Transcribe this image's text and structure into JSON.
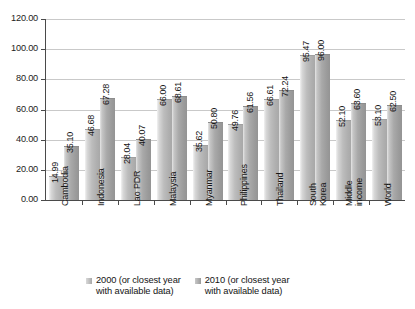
{
  "chart_data": {
    "type": "bar",
    "title": "",
    "subtitle": "",
    "xlabel": "",
    "ylabel": "",
    "ylim": [
      0,
      120
    ],
    "ytick_step": 20,
    "ytick_labels": [
      "0.00",
      "20.00",
      "40.00",
      "60.00",
      "80.00",
      "100.00",
      "120.00"
    ],
    "grid": true,
    "legend_position": "bottom",
    "categories": [
      "Cambodia",
      "Indonesia",
      "Lao PDR",
      "Malaysia",
      "Myanmar",
      "Philippines",
      "South Korea",
      "Thailand",
      "Middle income",
      "World"
    ],
    "category_display": [
      [
        "Cambodia"
      ],
      [
        "Indonesia"
      ],
      [
        "Lao PDR"
      ],
      [
        "Malaysia"
      ],
      [
        "Myanmar"
      ],
      [
        "Philippines"
      ],
      [
        "Thailand"
      ],
      [
        "South",
        "Korea"
      ],
      [
        "Middle",
        "income"
      ],
      [
        "World"
      ]
    ],
    "series": [
      {
        "name": "2000 (or closest year with available data)",
        "values": [
          14.99,
          46.68,
          28.04,
          66.0,
          35.62,
          49.76,
          66.61,
          95.47,
          52.1,
          53.1
        ],
        "value_labels": [
          "14.99",
          "46.68",
          "28.04",
          "66.00",
          "35.62",
          "49.76",
          "66.61",
          "95.47",
          "52.10",
          "53.10"
        ],
        "color": "#b5b5b5"
      },
      {
        "name": "2010 (or closest year with available data)",
        "values": [
          35.1,
          67.28,
          40.07,
          68.61,
          50.8,
          61.56,
          72.24,
          96.0,
          63.6,
          62.5
        ],
        "value_labels": [
          "35.10",
          "67.28",
          "40.07",
          "68.61",
          "50.80",
          "61.56",
          "72.24",
          "96.00",
          "63.60",
          "62.50"
        ],
        "color": "#a2a2a2"
      }
    ],
    "ordered_categories": [
      "Cambodia",
      "Indonesia",
      "Lao PDR",
      "Malaysia",
      "Myanmar",
      "Philippines",
      "Thailand",
      "South Korea",
      "Middle income",
      "World"
    ]
  },
  "legend": {
    "entries": [
      {
        "label": "2000 (or closest year\nwith available data)"
      },
      {
        "label": "2010 (or closest year\nwith available data)"
      }
    ]
  },
  "axis": {
    "y_ticks": [
      "120.00",
      "100.00",
      "80.00",
      "60.00",
      "40.00",
      "20.00",
      "0.00"
    ]
  }
}
